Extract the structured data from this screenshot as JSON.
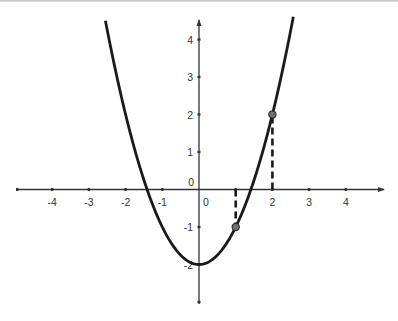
{
  "chart_data": {
    "type": "line",
    "title": "",
    "function": "y = x^2 - 2",
    "xlabel": "",
    "ylabel": "",
    "xlim": [
      -5,
      5
    ],
    "ylim": [
      -3,
      4.5
    ],
    "grid": false,
    "x_ticks": [
      -4,
      -3,
      -2,
      -1,
      0,
      1,
      2,
      3,
      4
    ],
    "x_tick_labels": [
      "-4",
      "-3",
      "-2",
      "-1",
      "0",
      "",
      "2",
      "3",
      "4"
    ],
    "y_ticks": [
      4,
      3,
      2,
      1,
      0,
      -1,
      -2,
      -3
    ],
    "y_tick_labels": [
      "4",
      "3",
      "2",
      "1",
      "0",
      "-1",
      "-2",
      ""
    ],
    "series": [
      {
        "name": "parabola",
        "x": [
          -2.6,
          -2,
          -1.5,
          -1,
          -0.5,
          0,
          0.5,
          1,
          1.5,
          2,
          2.6
        ],
        "values": [
          4.76,
          2,
          0.25,
          -1,
          -1.75,
          -2,
          -1.75,
          -1,
          0.25,
          2,
          4.76
        ],
        "color": "#1a1a1a"
      }
    ],
    "points": [
      {
        "x": 1,
        "y": -1,
        "label": ""
      },
      {
        "x": 2,
        "y": 2,
        "label": ""
      }
    ],
    "dashed_segments": [
      {
        "from": [
          1,
          0
        ],
        "to": [
          1,
          -1
        ]
      },
      {
        "from": [
          2,
          0
        ],
        "to": [
          2,
          2
        ]
      }
    ],
    "colors": {
      "curve": "#1a1a1a",
      "axis": "#333333",
      "point_fill": "#707070",
      "point_stroke": "#2a2a2a"
    }
  },
  "labels": {
    "origin_y": "0",
    "origin_x": "0"
  }
}
